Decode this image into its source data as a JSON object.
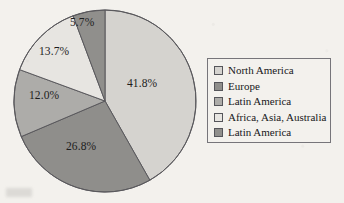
{
  "chart_data": {
    "type": "pie",
    "title": "",
    "categories": [
      "North America",
      "Europe",
      "Latin America",
      "Africa, Asia, Australia",
      "Latin America"
    ],
    "values": [
      41.8,
      26.8,
      12.0,
      13.7,
      5.7
    ],
    "labels": [
      "41.8%",
      "26.8%",
      "12.0%",
      "13.7%",
      "5.7%"
    ],
    "colors": [
      "#d5d3cf",
      "#8f8e8b",
      "#adaca9",
      "#e7e5e1",
      "#908f8c"
    ],
    "start_angle_deg": 0,
    "direction": "clockwise",
    "legend_position": "right",
    "grid": false,
    "units": "percent"
  },
  "legend": {
    "items": [
      {
        "label": "North America",
        "color": "#d5d3cf"
      },
      {
        "label": "Europe",
        "color": "#8f8e8b"
      },
      {
        "label": "Latin America",
        "color": "#adaca9"
      },
      {
        "label": "Africa, Asia, Australia",
        "color": "#e7e5e1"
      },
      {
        "label": "Latin America",
        "color": "#908f8c"
      }
    ]
  },
  "slice_labels": [
    {
      "text": "41.8%",
      "x": 127,
      "y": 77
    },
    {
      "text": "26.8%",
      "x": 66,
      "y": 140
    },
    {
      "text": "12.0%",
      "x": 29,
      "y": 89
    },
    {
      "text": "13.7%",
      "x": 39,
      "y": 45
    },
    {
      "text": "5.7%",
      "x": 70,
      "y": 16
    }
  ],
  "style": {
    "background": "#f3f1ed",
    "outline": "#5a595d",
    "text": "#1d1d1d"
  }
}
